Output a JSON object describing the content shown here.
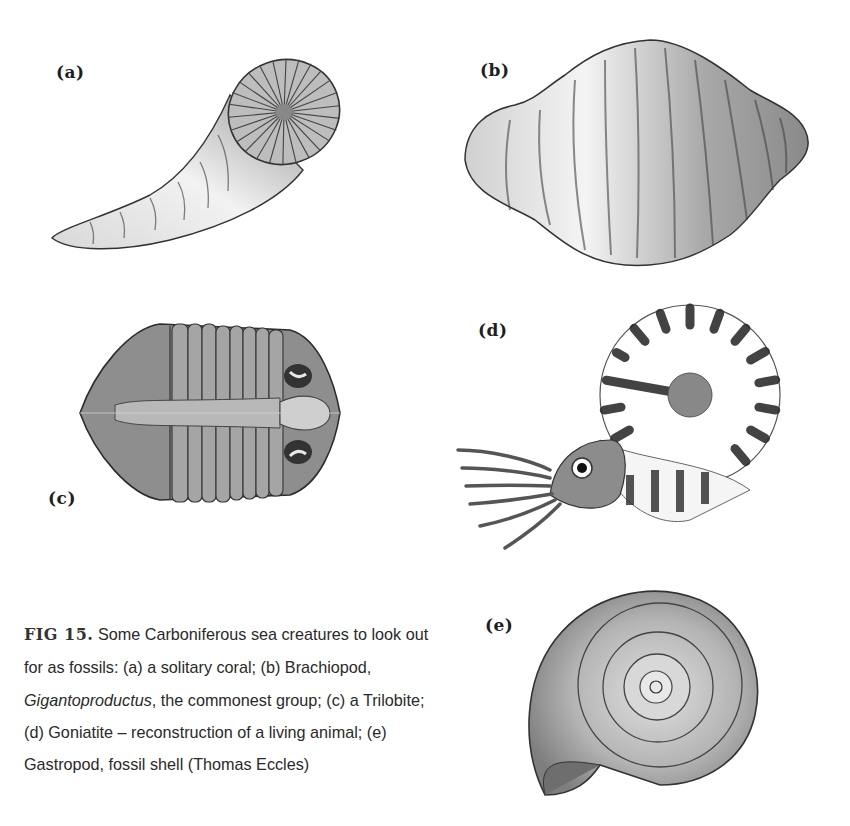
{
  "figure": {
    "number": "FIG 15.",
    "panels": [
      {
        "id": "a",
        "label": "(a)",
        "subject": "solitary coral"
      },
      {
        "id": "b",
        "label": "(b)",
        "subject": "Brachiopod, Gigantoproductus"
      },
      {
        "id": "c",
        "label": "(c)",
        "subject": "Trilobite"
      },
      {
        "id": "d",
        "label": "(d)",
        "subject": "Goniatite reconstruction"
      },
      {
        "id": "e",
        "label": "(e)",
        "subject": "Gastropod fossil shell"
      }
    ],
    "caption": {
      "part1": "Some Carboniferous sea creatures to look out for as fossils: (a) a solitary coral; (b) Brachiopod, ",
      "italic": "Gigantoproductus",
      "part2": ", the commonest group; (c) a Trilobite; (d) Goniatite – reconstruction of a living animal; (e) Gastropod, fossil shell (Thomas Eccles)"
    }
  }
}
